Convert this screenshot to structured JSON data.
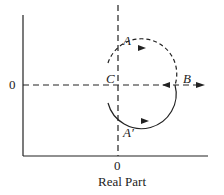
{
  "diagram": {
    "labels": {
      "A": "A",
      "A_prime": "A′",
      "B": "B",
      "C": "C"
    },
    "y_tick": "0",
    "x_tick": "0",
    "xlabel": "Real Part"
  }
}
